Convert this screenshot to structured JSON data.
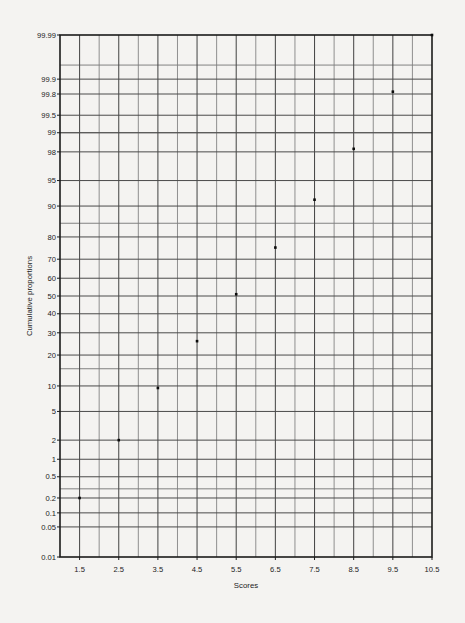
{
  "chart_data": {
    "type": "scatter",
    "title": "",
    "xlabel": "Scores",
    "ylabel": "Cumulative proportions",
    "grid": true,
    "legend": "none",
    "plot_kind": "normal-probability-plot",
    "x": [
      1.5,
      2.5,
      3.5,
      4.5,
      5.5,
      6.5,
      7.5,
      8.5,
      9.5,
      10.5
    ],
    "values": [
      0.2,
      2.0,
      9.5,
      26.0,
      51.0,
      75.5,
      91.5,
      98.2,
      99.82,
      99.99
    ],
    "points": [
      {
        "x": 1.5,
        "y": 0.2
      },
      {
        "x": 2.5,
        "y": 2.0
      },
      {
        "x": 3.5,
        "y": 9.5
      },
      {
        "x": 4.5,
        "y": 26.0
      },
      {
        "x": 5.5,
        "y": 51.0
      },
      {
        "x": 6.5,
        "y": 75.5
      },
      {
        "x": 7.5,
        "y": 91.5
      },
      {
        "x": 8.5,
        "y": 98.2
      },
      {
        "x": 9.5,
        "y": 99.82
      },
      {
        "x": 10.5,
        "y": 99.99
      }
    ],
    "xlim": [
      1.0,
      10.5
    ],
    "ylim": [
      0.01,
      99.99
    ],
    "xticks": [
      1.5,
      2.5,
      3.5,
      4.5,
      5.5,
      6.5,
      7.5,
      8.5,
      9.5,
      10.5
    ],
    "xtick_labels": [
      "1.5",
      "2.5",
      "3.5",
      "4.5",
      "5.5",
      "6.5",
      "7.5",
      "8.5",
      "9.5",
      "10.5"
    ],
    "yticks": [
      99.99,
      99.9,
      99.8,
      99.5,
      99,
      98,
      95,
      90,
      80,
      70,
      60,
      50,
      40,
      30,
      20,
      10,
      5,
      2,
      1,
      0.5,
      0.2,
      0.1,
      0.05,
      0.01
    ],
    "ytick_labels": [
      "99.99",
      "99.9",
      "99.8",
      "99.5",
      "99",
      "98",
      "95",
      "90",
      "80",
      "70",
      "60",
      "50",
      "40",
      "30",
      "20",
      "10",
      "5",
      "2",
      "1",
      "0.5",
      "0.2",
      "0.1",
      "0.05",
      "0.01"
    ],
    "y_gridlines_unlabeled": [
      99.95,
      99.0,
      85.0,
      15.0,
      0.3
    ],
    "x_gridlines_minor_step": 0.5
  },
  "axes": {
    "x_title": "Scores",
    "y_title": "Cumulative proportions"
  },
  "colors": {
    "background": "#f4f3f1",
    "frame": "#1b1b1b",
    "grid": "#6d6d6d",
    "point": "#0b0b0b",
    "text": "#1b1b1b"
  }
}
